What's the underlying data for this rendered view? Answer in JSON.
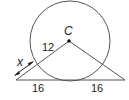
{
  "diagram": {
    "type": "geometry",
    "colors": {
      "stroke": "#555555",
      "text": "#222222",
      "background": "#ffffff"
    },
    "circle": {
      "center_label": "C",
      "radius_label": "12"
    },
    "segments": {
      "tangent_left_label": "16",
      "tangent_right_label": "16",
      "unknown_label": "x"
    }
  }
}
